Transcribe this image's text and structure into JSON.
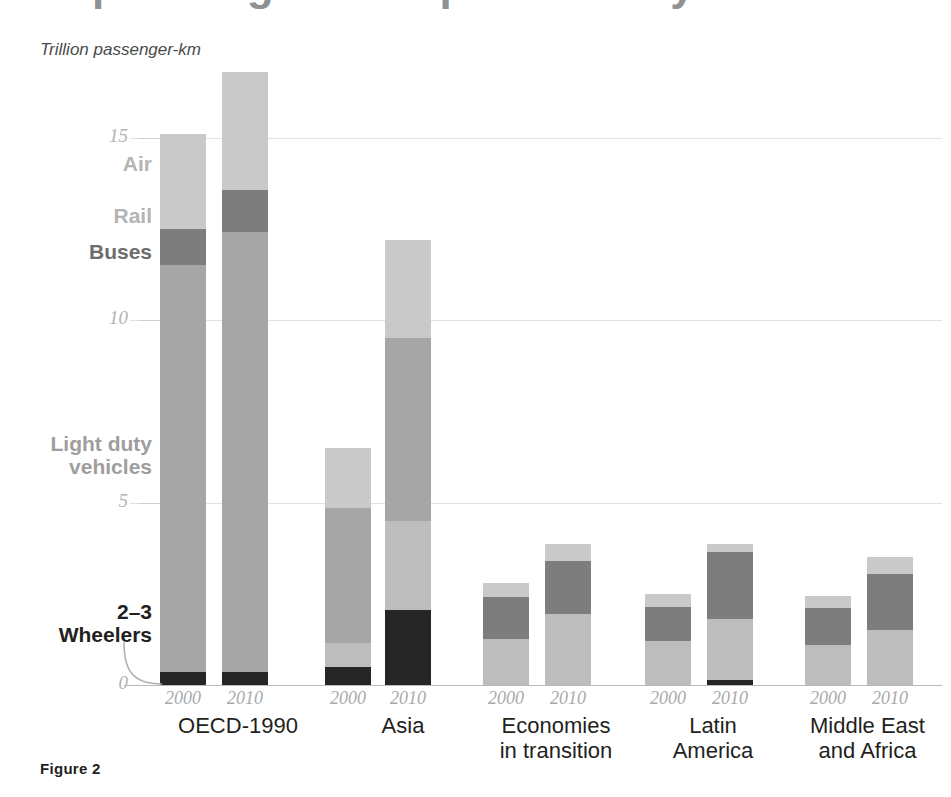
{
  "figure": {
    "caption": "Figure 2",
    "units_label": "Trillion passenger-km",
    "clipped_heading": "passenger transport activity"
  },
  "axis": {
    "y_ticks": [
      "0",
      "5",
      "10",
      "15"
    ],
    "y_tick_values": [
      0,
      5,
      10,
      15
    ],
    "ymin": 0,
    "ymax": 17.5
  },
  "series_labels": {
    "air": "Air",
    "rail": "Rail",
    "buses": "Buses",
    "light_duty": "Light duty\nvehicles",
    "wheelers": "2–3\nWheelers"
  },
  "colors": {
    "air": "#c9c9c9",
    "rail": "#bdbdbd",
    "buses": "#7d7d7d",
    "light_duty": "#a6a6a6",
    "wheelers": "#262626",
    "gridline": "#e2e2e2",
    "axis": "#b9b9b9",
    "tick_text": "#b3b3b3",
    "group_text": "#231f20"
  },
  "groups": [
    {
      "name": "OECD-1990",
      "label_lines": [
        "OECD-1990"
      ]
    },
    {
      "name": "Asia",
      "label_lines": [
        "Asia"
      ]
    },
    {
      "name": "Economies in transition",
      "label_lines": [
        "Economies",
        "in transition"
      ]
    },
    {
      "name": "Latin America",
      "label_lines": [
        "Latin",
        "America"
      ]
    },
    {
      "name": "Middle East and Africa",
      "label_lines": [
        "Middle East",
        "and Africa"
      ]
    }
  ],
  "years": [
    "2000",
    "2010"
  ],
  "chart_data": {
    "type": "bar",
    "subtype": "stacked",
    "title": "",
    "xlabel": "",
    "ylabel": "Trillion passenger-km",
    "ylim": [
      0,
      17.5
    ],
    "yticks": [
      0,
      5,
      10,
      15
    ],
    "grid": true,
    "legend": "inline-annotations-left",
    "categories": [
      "OECD-1990 2000",
      "OECD-1990 2010",
      "Asia 2000",
      "Asia 2010",
      "Economies in transition 2000",
      "Economies in transition 2010",
      "Latin America 2000",
      "Latin America 2010",
      "Middle East and Africa 2000",
      "Middle East and Africa 2010"
    ],
    "series": [
      {
        "name": "2–3 Wheelers",
        "color": "#262626",
        "values": [
          0.35,
          0.35,
          0.5,
          2.05,
          0.0,
          0.0,
          0.0,
          0.15,
          0.0,
          0.0
        ]
      },
      {
        "name": "Rail",
        "color": "#bdbdbd",
        "values": [
          0.0,
          0.0,
          0.65,
          2.45,
          1.25,
          1.95,
          1.2,
          1.65,
          1.1,
          1.5
        ]
      },
      {
        "name": "Light duty vehicles",
        "color": "#a6a6a6",
        "values": [
          11.15,
          12.05,
          3.7,
          5.0,
          0.0,
          0.0,
          0.0,
          0.0,
          0.0,
          0.0
        ]
      },
      {
        "name": "Buses",
        "color": "#7d7d7d",
        "values": [
          1.0,
          1.15,
          0.0,
          0.0,
          1.15,
          1.45,
          0.95,
          1.85,
          1.0,
          1.55
        ]
      },
      {
        "name": "Air",
        "color": "#c9c9c9",
        "values": [
          2.6,
          3.25,
          1.65,
          2.7,
          0.4,
          0.45,
          0.35,
          0.2,
          0.35,
          0.45
        ]
      }
    ],
    "totals": [
      15.1,
      16.8,
      6.5,
      12.2,
      2.8,
      3.85,
      2.5,
      3.85,
      2.45,
      3.5
    ]
  },
  "bars": [
    {
      "group": 0,
      "year": "2000",
      "x": 160,
      "total": 15.1,
      "segments": [
        {
          "name": "air",
          "value": 2.6
        },
        {
          "name": "buses",
          "value": 1.0
        },
        {
          "name": "light_duty",
          "value": 11.15
        },
        {
          "name": "wheelers",
          "value": 0.35
        }
      ]
    },
    {
      "group": 0,
      "year": "2010",
      "x": 222,
      "total": 16.8,
      "segments": [
        {
          "name": "air",
          "value": 3.25
        },
        {
          "name": "buses",
          "value": 1.15
        },
        {
          "name": "light_duty",
          "value": 12.05
        },
        {
          "name": "wheelers",
          "value": 0.35
        }
      ]
    },
    {
      "group": 1,
      "year": "2000",
      "x": 325,
      "total": 6.5,
      "segments": [
        {
          "name": "air",
          "value": 1.65
        },
        {
          "name": "light_duty",
          "value": 3.7
        },
        {
          "name": "rail",
          "value": 0.65
        },
        {
          "name": "wheelers",
          "value": 0.5
        }
      ]
    },
    {
      "group": 1,
      "year": "2010",
      "x": 385,
      "total": 12.2,
      "segments": [
        {
          "name": "air",
          "value": 2.7
        },
        {
          "name": "light_duty",
          "value": 5.0
        },
        {
          "name": "rail",
          "value": 2.45
        },
        {
          "name": "wheelers",
          "value": 2.05
        }
      ]
    },
    {
      "group": 2,
      "year": "2000",
      "x": 483,
      "total": 2.8,
      "segments": [
        {
          "name": "air",
          "value": 0.4
        },
        {
          "name": "buses",
          "value": 1.15
        },
        {
          "name": "rail",
          "value": 1.25
        }
      ]
    },
    {
      "group": 2,
      "year": "2010",
      "x": 545,
      "total": 3.85,
      "segments": [
        {
          "name": "air",
          "value": 0.45
        },
        {
          "name": "buses",
          "value": 1.45
        },
        {
          "name": "rail",
          "value": 1.95
        }
      ]
    },
    {
      "group": 3,
      "year": "2000",
      "x": 645,
      "total": 2.5,
      "segments": [
        {
          "name": "air",
          "value": 0.35
        },
        {
          "name": "buses",
          "value": 0.95
        },
        {
          "name": "rail",
          "value": 1.2
        }
      ]
    },
    {
      "group": 3,
      "year": "2010",
      "x": 707,
      "total": 3.85,
      "segments": [
        {
          "name": "air",
          "value": 0.2
        },
        {
          "name": "buses",
          "value": 1.85
        },
        {
          "name": "rail",
          "value": 1.65
        },
        {
          "name": "wheelers",
          "value": 0.15
        }
      ]
    },
    {
      "group": 4,
      "year": "2000",
      "x": 805,
      "total": 2.45,
      "segments": [
        {
          "name": "air",
          "value": 0.35
        },
        {
          "name": "buses",
          "value": 1.0
        },
        {
          "name": "rail",
          "value": 1.1
        }
      ]
    },
    {
      "group": 4,
      "year": "2010",
      "x": 867,
      "total": 3.5,
      "segments": [
        {
          "name": "air",
          "value": 0.45
        },
        {
          "name": "buses",
          "value": 1.55
        },
        {
          "name": "rail",
          "value": 1.5
        }
      ]
    }
  ],
  "group_label_positions": [
    {
      "left": 148,
      "width": 180
    },
    {
      "left": 313,
      "width": 180
    },
    {
      "left": 456,
      "width": 200
    },
    {
      "left": 628,
      "width": 170
    },
    {
      "left": 770,
      "width": 195
    }
  ]
}
